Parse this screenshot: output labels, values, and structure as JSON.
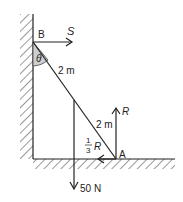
{
  "diagram": {
    "points": {
      "top": "B",
      "bottom": "A"
    },
    "angle_label": "θ",
    "segment_labels": [
      "2 m",
      "2 m"
    ],
    "forces": {
      "wall_reaction": "S",
      "normal_reaction": "R",
      "friction": "R",
      "friction_coeff_num": "1",
      "friction_coeff_den": "3",
      "weight": "50 N"
    }
  }
}
